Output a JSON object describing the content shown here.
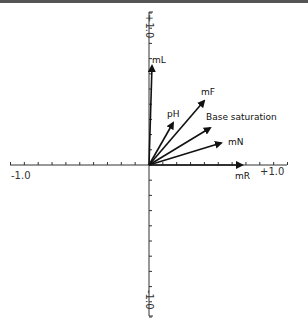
{
  "chart_data": {
    "type": "biplot-vectors",
    "title": "",
    "xlabel": "",
    "ylabel": "",
    "xlim": [
      -1.0,
      1.0
    ],
    "ylim": [
      -1.0,
      1.0
    ],
    "tick_labels": {
      "x_min": "-1.0",
      "x_max": "+1.0",
      "y_min": "-1.0",
      "y_max": "+1.0"
    },
    "grid": false,
    "vectors": [
      {
        "name": "mL",
        "x": 0.02,
        "y": 0.66
      },
      {
        "name": "mF",
        "x": 0.4,
        "y": 0.43
      },
      {
        "name": "pH",
        "x": 0.17,
        "y": 0.28
      },
      {
        "name": "Base saturation",
        "x": 0.44,
        "y": 0.24
      },
      {
        "name": "mN",
        "x": 0.52,
        "y": 0.14
      },
      {
        "name": "mR",
        "x": 0.67,
        "y": 0.0
      }
    ]
  },
  "labels": {
    "mL": "mL",
    "mF": "mF",
    "pH": "pH",
    "base": "Base saturation",
    "mN": "mN",
    "mR": "mR",
    "x_min": "-1.0",
    "x_max": "+1.0",
    "y_min": "-1.0",
    "y_max": "+1.0"
  }
}
